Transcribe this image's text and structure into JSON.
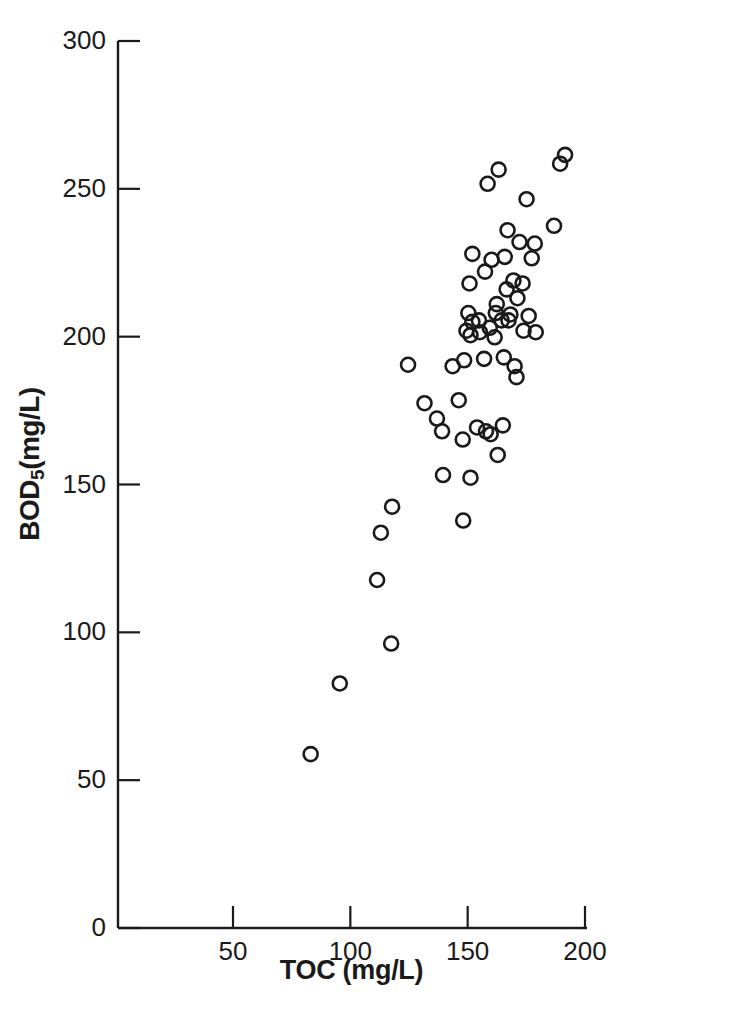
{
  "figure": {
    "background_color": "#ffffff",
    "ink_color": "#1a1a1a",
    "width": 742,
    "height": 1011
  },
  "axes": {
    "ylabel_main": "BOD",
    "ylabel_sub": "5",
    "ylabel_tail": "(mg/L)",
    "xlabel": "TOC (mg/L)",
    "y_ticks": [
      "0",
      "50",
      "100",
      "150",
      "200",
      "250",
      "300"
    ],
    "x_ticks": [
      "50",
      "100",
      "150",
      "200"
    ],
    "y_tick_values": [
      0,
      50,
      100,
      150,
      200,
      250,
      300
    ],
    "x_tick_values": [
      50,
      100,
      150,
      200
    ]
  },
  "caption_sliver": "",
  "chart_data": {
    "type": "scatter",
    "title": "",
    "xlabel": "TOC (mg/L)",
    "ylabel": "BOD5 (mg/L)",
    "xlim": [
      1,
      200
    ],
    "ylim": [
      0,
      300
    ],
    "grid": false,
    "legend": null,
    "marker": "open-circle",
    "marker_size_px": 14,
    "marker_stroke_px": 2.6,
    "marker_color": "#1a1a1a",
    "n_points": 61,
    "x": [
      83.1,
      95.5,
      111.4,
      117.4,
      113.0,
      117.8,
      124.6,
      131.6,
      136.9,
      139.1,
      139.5,
      143.6,
      146.2,
      147.9,
      148.1,
      148.5,
      149.5,
      150.3,
      150.8,
      151.2,
      151.2,
      152.0,
      152.0,
      154.0,
      154.8,
      155.2,
      157.0,
      157.4,
      157.8,
      158.5,
      159.4,
      159.8,
      160.2,
      161.5,
      162.0,
      162.4,
      162.8,
      163.2,
      164.5,
      165.0,
      165.4,
      165.8,
      166.6,
      167.0,
      167.4,
      168.2,
      169.5,
      170.0,
      170.8,
      171.2,
      172.1,
      173.4,
      173.8,
      175.1,
      176.0,
      177.3,
      178.6,
      179.0,
      186.8,
      189.4,
      191.5
    ],
    "y": [
      58.8,
      82.7,
      117.7,
      96.2,
      133.7,
      142.5,
      190.5,
      177.5,
      172.3,
      168.0,
      153.2,
      190.0,
      178.5,
      165.2,
      137.8,
      192.0,
      202.0,
      208.0,
      218.0,
      152.3,
      200.5,
      205.0,
      228.0,
      169.3,
      205.5,
      201.5,
      192.5,
      222.0,
      168.0,
      251.7,
      203.0,
      167.0,
      226.0,
      199.8,
      208.0,
      211.0,
      160.0,
      256.5,
      205.5,
      170.0,
      193.0,
      227.0,
      216.0,
      236.0,
      205.5,
      207.5,
      219.0,
      190.0,
      186.3,
      213.0,
      232.0,
      218.0,
      202.0,
      246.5,
      207.0,
      226.5,
      231.5,
      201.5,
      237.5,
      258.5,
      261.5
    ],
    "points": [
      {
        "x": 83.1,
        "y": 58.8
      },
      {
        "x": 95.5,
        "y": 82.7
      },
      {
        "x": 111.4,
        "y": 117.7
      },
      {
        "x": 117.4,
        "y": 96.2
      },
      {
        "x": 113.0,
        "y": 133.7
      },
      {
        "x": 117.8,
        "y": 142.5
      },
      {
        "x": 124.6,
        "y": 190.5
      },
      {
        "x": 131.6,
        "y": 177.5
      },
      {
        "x": 136.9,
        "y": 172.3
      },
      {
        "x": 139.1,
        "y": 168.0
      },
      {
        "x": 139.5,
        "y": 153.2
      },
      {
        "x": 143.6,
        "y": 190.0
      },
      {
        "x": 146.2,
        "y": 178.5
      },
      {
        "x": 147.9,
        "y": 165.2
      },
      {
        "x": 148.1,
        "y": 137.8
      },
      {
        "x": 148.5,
        "y": 192.0
      },
      {
        "x": 149.5,
        "y": 202.0
      },
      {
        "x": 150.3,
        "y": 208.0
      },
      {
        "x": 150.8,
        "y": 218.0
      },
      {
        "x": 151.2,
        "y": 152.3
      },
      {
        "x": 151.2,
        "y": 200.5
      },
      {
        "x": 152.0,
        "y": 205.0
      },
      {
        "x": 152.0,
        "y": 228.0
      },
      {
        "x": 154.0,
        "y": 169.3
      },
      {
        "x": 154.8,
        "y": 205.5
      },
      {
        "x": 155.2,
        "y": 201.5
      },
      {
        "x": 157.0,
        "y": 192.5
      },
      {
        "x": 157.4,
        "y": 222.0
      },
      {
        "x": 157.8,
        "y": 168.0
      },
      {
        "x": 158.5,
        "y": 251.7
      },
      {
        "x": 159.4,
        "y": 203.0
      },
      {
        "x": 159.8,
        "y": 167.0
      },
      {
        "x": 160.2,
        "y": 226.0
      },
      {
        "x": 161.5,
        "y": 199.8
      },
      {
        "x": 162.0,
        "y": 208.0
      },
      {
        "x": 162.4,
        "y": 211.0
      },
      {
        "x": 162.8,
        "y": 160.0
      },
      {
        "x": 163.2,
        "y": 256.5
      },
      {
        "x": 164.5,
        "y": 205.5
      },
      {
        "x": 165.0,
        "y": 170.0
      },
      {
        "x": 165.4,
        "y": 193.0
      },
      {
        "x": 165.8,
        "y": 227.0
      },
      {
        "x": 166.6,
        "y": 216.0
      },
      {
        "x": 167.0,
        "y": 236.0
      },
      {
        "x": 167.4,
        "y": 205.5
      },
      {
        "x": 168.2,
        "y": 207.5
      },
      {
        "x": 169.5,
        "y": 219.0
      },
      {
        "x": 170.0,
        "y": 190.0
      },
      {
        "x": 170.8,
        "y": 186.3
      },
      {
        "x": 171.2,
        "y": 213.0
      },
      {
        "x": 172.1,
        "y": 232.0
      },
      {
        "x": 173.4,
        "y": 218.0
      },
      {
        "x": 173.8,
        "y": 202.0
      },
      {
        "x": 175.1,
        "y": 246.5
      },
      {
        "x": 176.0,
        "y": 207.0
      },
      {
        "x": 177.3,
        "y": 226.5
      },
      {
        "x": 178.6,
        "y": 231.5
      },
      {
        "x": 179.0,
        "y": 201.5
      },
      {
        "x": 186.8,
        "y": 237.5
      },
      {
        "x": 189.4,
        "y": 258.5
      },
      {
        "x": 191.5,
        "y": 261.5
      }
    ]
  }
}
